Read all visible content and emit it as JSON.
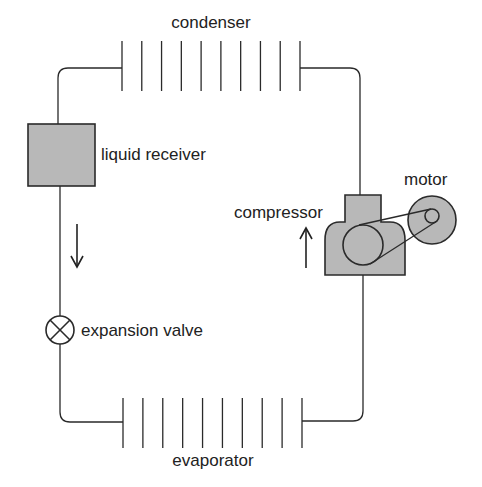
{
  "diagram": {
    "components": {
      "condenser": {
        "label": "condenser",
        "plate_count": 10
      },
      "liquid_receiver": {
        "label": "liquid receiver"
      },
      "expansion_valve": {
        "label": "expansion valve"
      },
      "evaporator": {
        "label": "evaporator",
        "plate_count": 10
      },
      "compressor": {
        "label": "compressor"
      },
      "motor": {
        "label": "motor"
      }
    },
    "flow": [
      {
        "from": "liquid_receiver",
        "to": "expansion_valve",
        "direction": "down"
      },
      {
        "from": "evaporator",
        "to": "compressor",
        "direction": "up"
      }
    ],
    "colors": {
      "line": "#2a2a2a",
      "fill": "#b8b8b8",
      "background": "#ffffff"
    }
  }
}
